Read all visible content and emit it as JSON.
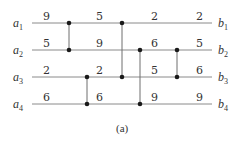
{
  "diagram": {
    "type": "sorting-network",
    "caption": "(a)",
    "inputs": [
      {
        "name": "a",
        "sub": "1"
      },
      {
        "name": "a",
        "sub": "2"
      },
      {
        "name": "a",
        "sub": "3"
      },
      {
        "name": "a",
        "sub": "4"
      }
    ],
    "outputs": [
      {
        "name": "b",
        "sub": "1"
      },
      {
        "name": "b",
        "sub": "2"
      },
      {
        "name": "b",
        "sub": "3"
      },
      {
        "name": "b",
        "sub": "4"
      }
    ],
    "wire_values": [
      [
        "9",
        "5",
        "2",
        "2"
      ],
      [
        "5",
        "9",
        "6",
        "5"
      ],
      [
        "2",
        "2",
        "5",
        "6"
      ],
      [
        "6",
        "6",
        "9",
        "9"
      ]
    ],
    "comparators": [
      {
        "x": 69,
        "from": 1,
        "to": 2
      },
      {
        "x": 87,
        "from": 3,
        "to": 4
      },
      {
        "x": 122,
        "from": 1,
        "to": 3
      },
      {
        "x": 140,
        "from": 2,
        "to": 4
      },
      {
        "x": 177,
        "from": 2,
        "to": 3
      }
    ]
  }
}
